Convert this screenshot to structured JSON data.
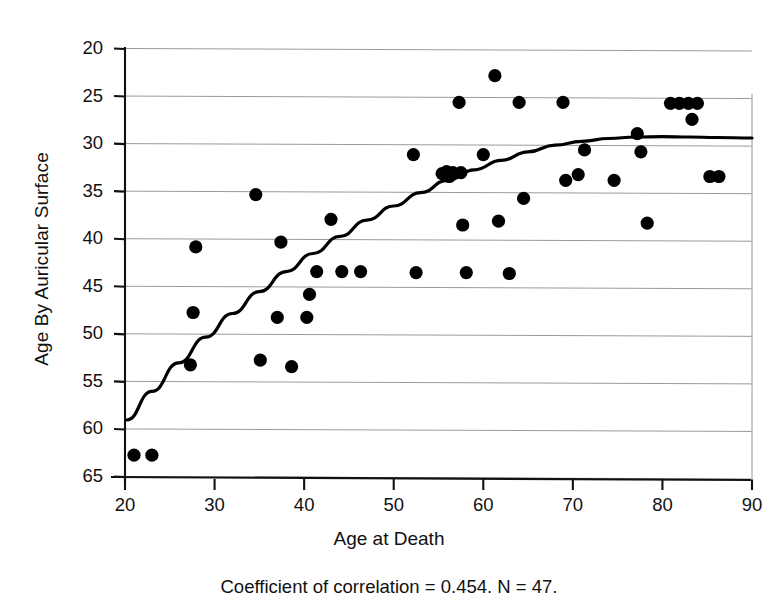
{
  "figure": {
    "caption": "Coefficient of correlation = 0.454. N = 47."
  },
  "chart_data": {
    "type": "scatter",
    "title": "",
    "xlabel": "Age at Death",
    "ylabel": "Age By Auricular Surface",
    "xlim": [
      20,
      90
    ],
    "ylim": [
      20,
      65
    ],
    "xticks": [
      20,
      30,
      40,
      50,
      60,
      70,
      80,
      90
    ],
    "yticks": [
      20,
      25,
      30,
      35,
      40,
      45,
      50,
      55,
      60,
      65
    ],
    "grid": "horizontal",
    "legend": "none",
    "correlation": 0.454,
    "n": 47,
    "points": [
      {
        "x": 21.0,
        "y": 22.4
      },
      {
        "x": 23.0,
        "y": 22.4
      },
      {
        "x": 27.3,
        "y": 31.9
      },
      {
        "x": 27.6,
        "y": 37.4
      },
      {
        "x": 27.9,
        "y": 44.3
      },
      {
        "x": 34.6,
        "y": 49.8
      },
      {
        "x": 35.1,
        "y": 32.4
      },
      {
        "x": 37.0,
        "y": 36.9
      },
      {
        "x": 37.4,
        "y": 44.8
      },
      {
        "x": 38.6,
        "y": 31.7
      },
      {
        "x": 40.3,
        "y": 36.9
      },
      {
        "x": 40.6,
        "y": 39.3
      },
      {
        "x": 41.4,
        "y": 41.7
      },
      {
        "x": 43.0,
        "y": 47.2
      },
      {
        "x": 44.2,
        "y": 41.7
      },
      {
        "x": 46.3,
        "y": 41.7
      },
      {
        "x": 52.2,
        "y": 54.0
      },
      {
        "x": 52.5,
        "y": 41.6
      },
      {
        "x": 55.4,
        "y": 52.0
      },
      {
        "x": 55.9,
        "y": 52.2
      },
      {
        "x": 56.2,
        "y": 51.7
      },
      {
        "x": 56.6,
        "y": 52.1
      },
      {
        "x": 57.3,
        "y": 59.5
      },
      {
        "x": 57.5,
        "y": 52.1
      },
      {
        "x": 57.7,
        "y": 46.6
      },
      {
        "x": 58.1,
        "y": 41.6
      },
      {
        "x": 60.0,
        "y": 54.0
      },
      {
        "x": 61.3,
        "y": 62.3
      },
      {
        "x": 61.7,
        "y": 47.0
      },
      {
        "x": 62.9,
        "y": 41.5
      },
      {
        "x": 64.0,
        "y": 59.5
      },
      {
        "x": 64.5,
        "y": 49.4
      },
      {
        "x": 68.9,
        "y": 59.5
      },
      {
        "x": 69.2,
        "y": 51.3
      },
      {
        "x": 70.6,
        "y": 51.9
      },
      {
        "x": 71.3,
        "y": 54.5
      },
      {
        "x": 74.6,
        "y": 51.3
      },
      {
        "x": 77.2,
        "y": 56.2
      },
      {
        "x": 77.6,
        "y": 54.3
      },
      {
        "x": 78.3,
        "y": 46.8
      },
      {
        "x": 80.9,
        "y": 59.4
      },
      {
        "x": 81.9,
        "y": 59.4
      },
      {
        "x": 82.9,
        "y": 59.4
      },
      {
        "x": 83.3,
        "y": 57.7
      },
      {
        "x": 83.9,
        "y": 59.4
      },
      {
        "x": 85.3,
        "y": 51.7
      },
      {
        "x": 86.3,
        "y": 51.7
      }
    ],
    "fit_curve": {
      "label": "lowess-fit",
      "x": [
        20.2,
        23,
        26,
        29,
        32,
        35,
        38,
        41,
        44,
        47,
        50,
        53,
        56,
        59,
        62,
        65,
        68,
        71,
        74,
        77,
        80,
        83,
        86,
        90
      ],
      "y": [
        26.1,
        29.1,
        32.1,
        34.8,
        37.3,
        39.6,
        41.7,
        43.6,
        45.4,
        47.1,
        48.6,
        50.0,
        51.3,
        52.4,
        53.4,
        54.3,
        55.0,
        55.4,
        55.7,
        55.85,
        55.9,
        55.85,
        55.8,
        55.75
      ]
    }
  },
  "axis": {
    "y_tick_labels": [
      "65",
      "60",
      "55",
      "50",
      "45",
      "40",
      "35",
      "30",
      "25",
      "20"
    ],
    "x_tick_labels": [
      "20",
      "30",
      "40",
      "50",
      "60",
      "70",
      "80",
      "90"
    ]
  }
}
